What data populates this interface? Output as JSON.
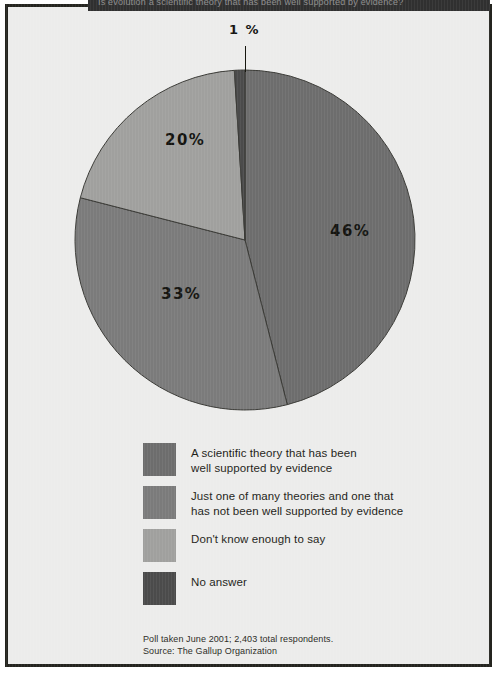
{
  "header": {
    "band_text": "Is evolution a scientific theory that has been well supported by evidence?",
    "band_color": "#303030"
  },
  "page": {
    "background": "#ececeb",
    "border_color": "#24241f"
  },
  "chart_data": {
    "type": "pie",
    "title": "",
    "subtitle": "",
    "legend_position": "bottom",
    "grid": false,
    "categories": [
      "A scientific theory that has been well supported by evidence",
      "Just one of many theories and one that has not been well supported by evidence",
      "Don't know enough to say",
      "No answer"
    ],
    "values": [
      46,
      33,
      20,
      1
    ],
    "value_labels": [
      "46%",
      "33%",
      "20%",
      "1 %"
    ],
    "colors": [
      "#6d6d6d",
      "#7b7b7b",
      "#a0a09e",
      "#4b4b4b"
    ],
    "units": "percent",
    "total_respondents": "2,403",
    "source": "The Gallup Organization",
    "poll_date": "June 2001"
  },
  "pie": {
    "center_x": 171,
    "center_y": 171,
    "radius": 170,
    "start_angle_deg": 0,
    "stroke_color": "#3a3a36",
    "slices": [
      {
        "name": "supported-by-evidence",
        "percent": 46,
        "color": "#6d6d6d",
        "label": "46%"
      },
      {
        "name": "not-well-supported",
        "percent": 33,
        "color": "#7b7b7b",
        "label": "33%"
      },
      {
        "name": "dont-know",
        "percent": 20,
        "color": "#a0a09e",
        "label": "20%"
      },
      {
        "name": "no-answer",
        "percent": 1,
        "color": "#4b4b4b",
        "label": "1 %"
      }
    ],
    "labels": {
      "one": "1 %",
      "twenty": "20%",
      "fortysix": "46%",
      "thirtythree": "33%"
    }
  },
  "legend": {
    "items": [
      {
        "swatch_color": "#6d6d6d",
        "line1": "A scientific theory that has been",
        "line2": "well supported by evidence"
      },
      {
        "swatch_color": "#7b7b7b",
        "line1": "Just one of many theories and one that",
        "line2": "has not been well supported by evidence"
      },
      {
        "swatch_color": "#a0a09e",
        "line1": "Don't know enough to say",
        "line2": ""
      },
      {
        "swatch_color": "#4b4b4b",
        "line1": "No answer",
        "line2": ""
      }
    ]
  },
  "footnote": {
    "line1": "Poll taken June 2001; 2,403 total respondents.",
    "line2": "Source: The Gallup Organization"
  }
}
